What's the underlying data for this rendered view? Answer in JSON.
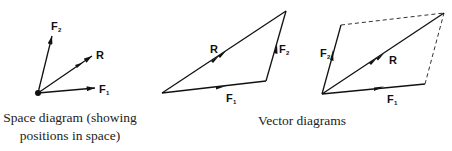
{
  "diagram": {
    "space_diagram": {
      "caption_line1": "Space diagram (showing",
      "caption_line2": "positions in space)",
      "labels": {
        "F2": {
          "main": "F",
          "sub": "2"
        },
        "R": {
          "main": "R"
        },
        "F1": {
          "main": "F",
          "sub": "1"
        }
      }
    },
    "vector_diagrams": {
      "caption": "Vector diagrams",
      "triangle": {
        "labels": {
          "R": {
            "main": "R"
          },
          "F2": {
            "main": "F",
            "sub": "2"
          },
          "F1": {
            "main": "F",
            "sub": "1"
          }
        }
      },
      "parallelogram": {
        "labels": {
          "F2": {
            "main": "F",
            "sub": "2"
          },
          "R": {
            "main": "R"
          },
          "F1": {
            "main": "F",
            "sub": "1"
          }
        }
      }
    },
    "colors": {
      "line": "#111111",
      "background": "#ffffff"
    }
  }
}
